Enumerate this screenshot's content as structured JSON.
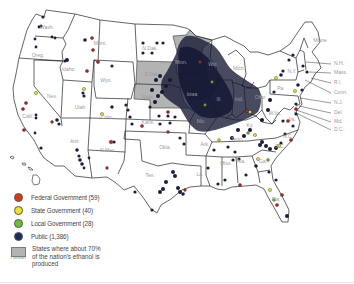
{
  "map": {
    "title": "",
    "region": "United States",
    "state_labels": [
      {
        "abbr": "Wash.",
        "x": 47,
        "y": 29
      },
      {
        "abbr": "Oreg.",
        "x": 38,
        "y": 57
      },
      {
        "abbr": "Idaho",
        "x": 68,
        "y": 71
      },
      {
        "abbr": "Mont.",
        "x": 100,
        "y": 45
      },
      {
        "abbr": "Wyo.",
        "x": 106,
        "y": 82
      },
      {
        "abbr": "Nev.",
        "x": 52,
        "y": 98
      },
      {
        "abbr": "Utah",
        "x": 80,
        "y": 109
      },
      {
        "abbr": "Colo.",
        "x": 107,
        "y": 119
      },
      {
        "abbr": "Calif.",
        "x": 28,
        "y": 118
      },
      {
        "abbr": "Ariz.",
        "x": 75,
        "y": 143
      },
      {
        "abbr": "N.Mex.",
        "x": 108,
        "y": 152
      },
      {
        "abbr": "Tex.",
        "x": 150,
        "y": 177
      },
      {
        "abbr": "Okla.",
        "x": 165,
        "y": 149
      },
      {
        "abbr": "Kans.",
        "x": 148,
        "y": 124
      },
      {
        "abbr": "Nebr.",
        "x": 148,
        "y": 99
      },
      {
        "abbr": "S.Dak.",
        "x": 152,
        "y": 76
      },
      {
        "abbr": "N.Dak.",
        "x": 150,
        "y": 50
      },
      {
        "abbr": "Minn.",
        "x": 181,
        "y": 64
      },
      {
        "abbr": "Ark.",
        "x": 205,
        "y": 146
      },
      {
        "abbr": "La.",
        "x": 200,
        "y": 176
      },
      {
        "abbr": "Miss.",
        "x": 226,
        "y": 165
      },
      {
        "abbr": "Ala.",
        "x": 241,
        "y": 163
      },
      {
        "abbr": "Ga.",
        "x": 263,
        "y": 163
      },
      {
        "abbr": "Fla.",
        "x": 276,
        "y": 201
      },
      {
        "abbr": "S.C.",
        "x": 280,
        "y": 148
      },
      {
        "abbr": "N.C.",
        "x": 288,
        "y": 138
      },
      {
        "abbr": "Va.",
        "x": 292,
        "y": 121
      },
      {
        "abbr": "W.Va.",
        "x": 275,
        "y": 115
      },
      {
        "abbr": "Ky.",
        "x": 250,
        "y": 127
      },
      {
        "abbr": "Tenn.",
        "x": 237,
        "y": 141
      },
      {
        "abbr": "Ohio",
        "x": 260,
        "y": 99
      },
      {
        "abbr": "Pa.",
        "x": 281,
        "y": 90
      },
      {
        "abbr": "N.Y.",
        "x": 292,
        "y": 73
      },
      {
        "abbr": "Mich.",
        "x": 239,
        "y": 70
      },
      {
        "abbr": "Wis.",
        "x": 213,
        "y": 66
      },
      {
        "abbr": "Ill.",
        "x": 219,
        "y": 101
      },
      {
        "abbr": "Ind.",
        "x": 239,
        "y": 101
      },
      {
        "abbr": "Mo.",
        "x": 201,
        "y": 123
      },
      {
        "abbr": "Iowa",
        "x": 192,
        "y": 96
      },
      {
        "abbr": "Maine",
        "x": 320,
        "y": 42
      },
      {
        "abbr": "Hawaii",
        "x": 18,
        "y": 259
      }
    ],
    "callout_labels": [
      {
        "abbr": "N.H.",
        "x": 334,
        "y": 65
      },
      {
        "abbr": "Mass.",
        "x": 334,
        "y": 74
      },
      {
        "abbr": "R.I.",
        "x": 334,
        "y": 84
      },
      {
        "abbr": "Conn.",
        "x": 334,
        "y": 94
      },
      {
        "abbr": "N.J.",
        "x": 334,
        "y": 104
      },
      {
        "abbr": "Del.",
        "x": 334,
        "y": 114
      },
      {
        "abbr": "Md.",
        "x": 334,
        "y": 123
      },
      {
        "abbr": "D.C.",
        "x": 334,
        "y": 131
      }
    ],
    "shaded_states": [
      "Minn.",
      "S.Dak.",
      "Nebr.",
      "Iowa"
    ],
    "colors": {
      "shaded_state": "#b3b3b3",
      "federal": "#d9391a",
      "state": "#f0e030",
      "local": "#6cbf3c",
      "public": "#1f2a5c",
      "outline": "#222222"
    }
  },
  "legend": {
    "items": [
      {
        "key": "federal",
        "label": "Federal Government (59)",
        "color": "#d9391a"
      },
      {
        "key": "state",
        "label": "State Government (40)",
        "color": "#f0e030"
      },
      {
        "key": "local",
        "label": "Local Government (28)",
        "color": "#6cbf3c"
      },
      {
        "key": "public",
        "label": "Public (1,386)",
        "color": "#1f2a5c"
      }
    ],
    "area_item": {
      "label": "States where about 70% of the nation's ethanol is produced",
      "color": "#b3b3b3"
    }
  }
}
